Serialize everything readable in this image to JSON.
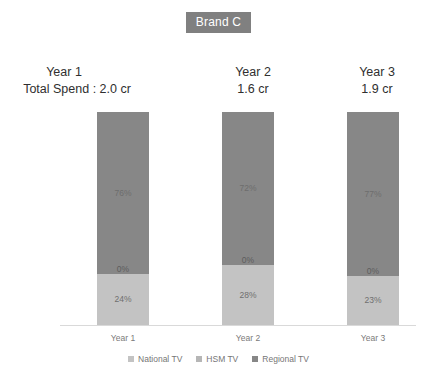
{
  "title": "Brand C",
  "spend_prefix": "Total Spend :",
  "chart_data": {
    "type": "bar",
    "subtype": "stacked-100",
    "title": "Brand C",
    "xlabel": "",
    "ylabel": "",
    "ylim": [
      0,
      100
    ],
    "grid": false,
    "legend_position": "bottom",
    "categories": [
      "Year 1",
      "Year 2",
      "Year 3"
    ],
    "series": [
      {
        "name": "National TV",
        "color": "#c3c3c3",
        "values": [
          24,
          28,
          23
        ]
      },
      {
        "name": "HSM TV",
        "color": "#8f8f8f",
        "values": [
          0,
          0,
          0
        ]
      },
      {
        "name": "Regional TV",
        "color": "#878787",
        "values": [
          76,
          72,
          77
        ]
      }
    ],
    "annotations": {
      "total_spend": [
        "2.0 cr",
        "1.6 cr",
        "1.9 cr"
      ]
    }
  },
  "headers": [
    {
      "year": "Year 1",
      "spend": "Total Spend : 2.0 cr"
    },
    {
      "year": "Year 2",
      "spend": "1.6 cr"
    },
    {
      "year": "Year 3",
      "spend": "1.9 cr"
    }
  ],
  "bars": [
    {
      "category": "Year 1",
      "regional_label": "76%",
      "hsm_label": "0%",
      "national_label": "24%"
    },
    {
      "category": "Year 2",
      "regional_label": "72%",
      "hsm_label": "0%",
      "national_label": "28%"
    },
    {
      "category": "Year 3",
      "regional_label": "77%",
      "hsm_label": "0%",
      "national_label": "23%"
    }
  ],
  "axis_labels": [
    "Year 1",
    "Year 2",
    "Year 3"
  ],
  "legend": [
    {
      "label": "National TV",
      "color": "#c3c3c3"
    },
    {
      "label": "HSM TV",
      "color": "#b6b6b6"
    },
    {
      "label": "Regional TV",
      "color": "#878787"
    }
  ]
}
